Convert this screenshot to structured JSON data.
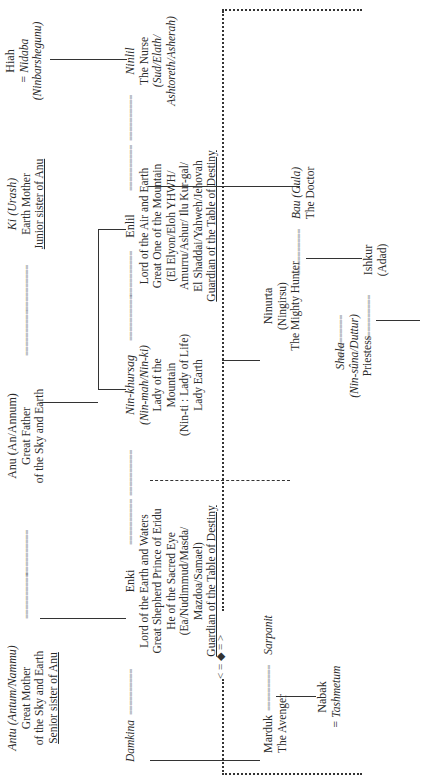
{
  "diagram": {
    "orientation": "rotated 90° counter-clockwise",
    "title": "",
    "nodes": {
      "antu": {
        "name": "Antu (Antum/Nammu)",
        "lines": [
          "Great Mother",
          "of the Sky and Earth"
        ],
        "underline": "Senior sister of Anu"
      },
      "anu": {
        "name": "Anu (An/Annum)",
        "lines": [
          "Great Father",
          "of the Sky and Earth"
        ]
      },
      "ki": {
        "name": "Ki (Urash)",
        "lines": [
          "Earth Mother"
        ],
        "underline": "Junior sister of Anu"
      },
      "hiah": {
        "name": "Hiah",
        "spouse": "= Nidaba",
        "alias": "(Ninbarshegunu)"
      },
      "damkina": {
        "name": "Damkina"
      },
      "enki": {
        "name": "Enki",
        "lines": [
          "Lord of the Earth and Waters",
          "Great Shepherd Prince of Eridu",
          "He of the Sacred Eye",
          "(Ea/Nudimmud/Masda/",
          "Mazdoa/Samael)"
        ],
        "underline": "Guardian of the Table of Destiny"
      },
      "ninkhursag": {
        "name": "Nin-khursag",
        "lines": [
          "(Nin-mah/Nin-ki)",
          "Lady of the",
          "Mountain",
          "(Nin-ti : Lady of Life)",
          "Lady Earth"
        ]
      },
      "enlil": {
        "name": "Enlil",
        "lines": [
          "Lord of the Air and Earth",
          "Great One of the Mountain",
          "(El Elyon/Eloh YHWH/",
          "Amurru/Ashur/ Ilu Kur-gal/",
          "El Shaddai/Yahweh/Jehovah"
        ],
        "underline": "Guardian of the Table of Destiny"
      },
      "ninlil": {
        "name": "Ninlil",
        "lines": [
          "The Nurse"
        ],
        "alias_lines": [
          "(Sud/Elath/",
          "Ashtoreth/Asherah)"
        ]
      },
      "marduk": {
        "name": "Marduk",
        "lines": [
          "The Avenger"
        ]
      },
      "sarpanit": {
        "name": "Sarpanit"
      },
      "nabak": {
        "name": "Nabak",
        "spouse": "= Tashmetum"
      },
      "ninurta": {
        "name": "Ninurta",
        "lines": [
          "(Ningirsu)",
          "The Mighty Hunter"
        ]
      },
      "bau": {
        "name": "Bau (Gula)",
        "lines": [
          "The Doctor"
        ]
      },
      "shala": {
        "name": "Shala",
        "alias": "(Nin-sûna/Duttur)",
        "lines": [
          "Priestess"
        ]
      },
      "ishkur": {
        "name": "Ishkur",
        "lines": [
          "(Adad)"
        ]
      }
    },
    "marriage_connector": "==========",
    "rivalry_marker": "< = ◆ = >",
    "colors": {
      "ink": "#2a2a2a",
      "background": "#ffffff"
    }
  }
}
